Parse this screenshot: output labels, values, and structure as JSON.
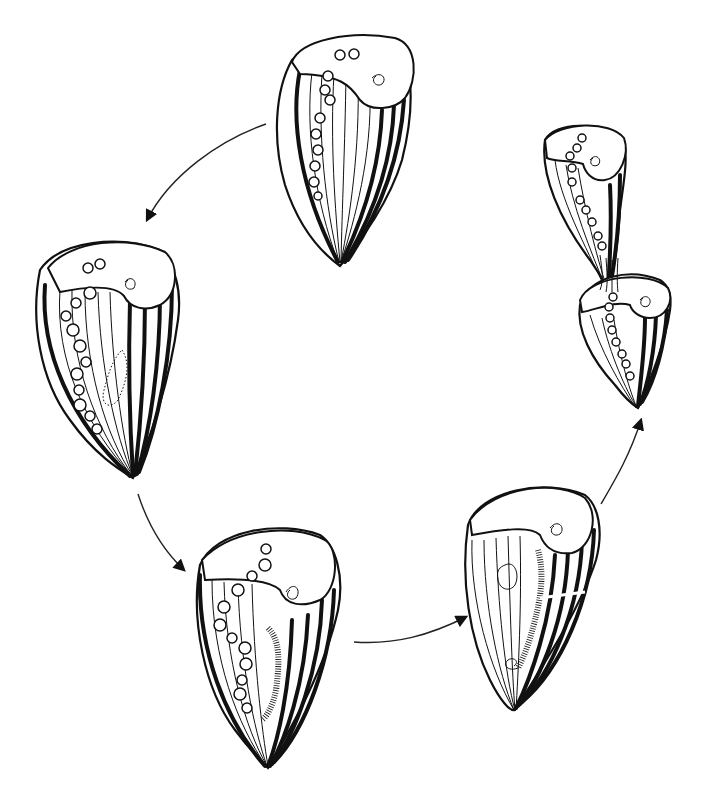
{
  "figure": {
    "title": "",
    "colors": {
      "ink": "#111111",
      "background": "#ffffff"
    },
    "stages": [
      {
        "id": 1,
        "position": "top-center",
        "label": "",
        "description": "Mature cell with oral spiral and beaded macronucleus"
      },
      {
        "id": 2,
        "position": "left",
        "label": "",
        "description": "New oral primordium forming (stippled) along stripe zone"
      },
      {
        "id": 3,
        "position": "bottom-left",
        "label": "",
        "description": "Oral primordium elongated with membranelles"
      },
      {
        "id": 4,
        "position": "bottom-right",
        "label": "",
        "description": "Fission line appearing; new mouth spiral at posterior"
      },
      {
        "id": 5,
        "position": "top-right",
        "label": "",
        "description": "Two daughter cells separating"
      }
    ],
    "arrows": [
      {
        "from": 1,
        "to": 2,
        "label": ""
      },
      {
        "from": 2,
        "to": 3,
        "label": ""
      },
      {
        "from": 3,
        "to": 4,
        "label": ""
      },
      {
        "from": 4,
        "to": 5,
        "label": ""
      }
    ]
  }
}
